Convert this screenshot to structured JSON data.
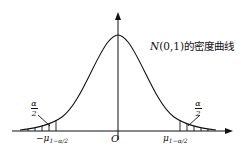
{
  "figure": {
    "curve_label": {
      "italic": "N",
      "rest": "(0,1)的密度曲线"
    },
    "origin_label": "O",
    "left_quantile": {
      "prefix": "−μ",
      "sub": "1−α/2"
    },
    "right_quantile": {
      "prefix": "μ",
      "sub": "1−α/2"
    },
    "tail_fraction": {
      "num": "α",
      "den": "2"
    }
  },
  "colors": {
    "line": "#111111",
    "background": "#ffffff"
  }
}
